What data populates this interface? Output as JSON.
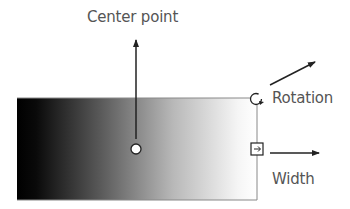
{
  "diagram": {
    "labels": {
      "center_point": "Center point",
      "rotation": "Rotation",
      "width": "Width"
    },
    "gradient": {
      "start_color": "#000000",
      "end_color": "#ffffff"
    },
    "colors": {
      "stroke": "#222222",
      "text": "#555555",
      "border": "#777777"
    },
    "handles": [
      {
        "name": "center-point-handle",
        "shape": "circle"
      },
      {
        "name": "rotation-handle",
        "shape": "circle-arrow"
      },
      {
        "name": "width-handle",
        "shape": "square-arrow"
      }
    ]
  }
}
